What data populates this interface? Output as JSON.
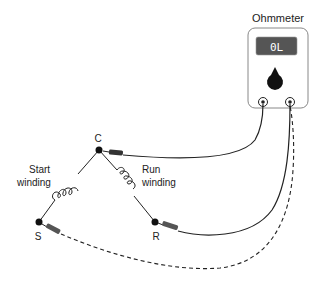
{
  "diagram": {
    "meter": {
      "title": "Ohmmeter",
      "display_value": "0L"
    },
    "nodes": {
      "common": "C",
      "start": "S",
      "run": "R"
    },
    "windings": {
      "start_line1": "Start",
      "start_line2": "winding",
      "run_line1": "Run",
      "run_line2": "winding"
    },
    "leads": [
      {
        "from": "meter-left-terminal",
        "to": "C",
        "style": "solid"
      },
      {
        "from": "meter-right-terminal",
        "to": "R",
        "style": "solid"
      },
      {
        "from": "meter-right-terminal",
        "to": "S",
        "style": "dashed"
      }
    ],
    "colors": {
      "line": "#222222",
      "display_bg": "#555555",
      "probe": "#444444",
      "meter_border": "#888888"
    }
  }
}
